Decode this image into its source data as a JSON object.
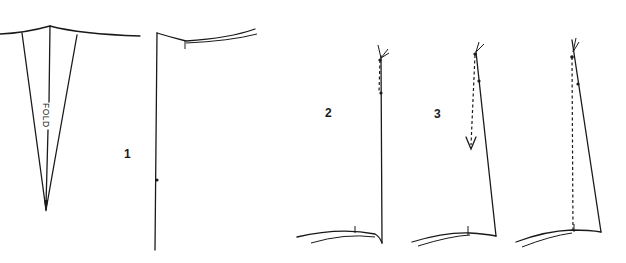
{
  "diagram": {
    "labels": {
      "fold": "FOLD",
      "step1": "1",
      "step2": "2",
      "step3": "3"
    },
    "colors": {
      "line": "#1a1a1a",
      "background": "#ffffff"
    }
  }
}
